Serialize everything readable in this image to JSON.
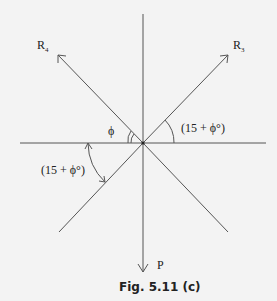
{
  "figure": {
    "caption": "Fig. 5.11 (c)",
    "labels": {
      "r4": "R",
      "r4_sub": "4",
      "r3": "R",
      "r3_sub": "3",
      "p": "P",
      "phi": "ϕ",
      "angle_right": "(15 + ϕ°)",
      "angle_left": "(15 + ϕ°)"
    },
    "colors": {
      "line": "#555555",
      "background": "#f3f3f3"
    }
  }
}
